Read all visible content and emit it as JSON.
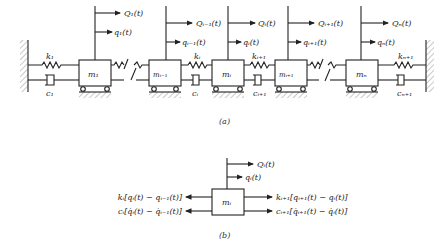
{
  "figure_a": {
    "caption": "(a)",
    "masses": [
      {
        "label": "m1",
        "text": "m₁"
      },
      {
        "label": "m_{i-1}",
        "text": "mᵢ₋₁"
      },
      {
        "label": "m_i",
        "text": "mᵢ"
      },
      {
        "label": "m_{i+1}",
        "text": "mᵢ₊₁"
      },
      {
        "label": "m_n",
        "text": "mₙ"
      }
    ],
    "forces": [
      {
        "Q": "Q₁(t)",
        "q": "q₁(t)"
      },
      {
        "Q": "Qᵢ₋₁(t)",
        "q": "qᵢ₋₁(t)"
      },
      {
        "Q": "Qᵢ(t)",
        "q": "qᵢ(t)"
      },
      {
        "Q": "Qᵢ₊₁(t)",
        "q": "qᵢ₊₁(t)"
      },
      {
        "Q": "Qₙ(t)",
        "q": "qₙ(t)"
      }
    ],
    "springs": [
      "k₁",
      "kᵢ",
      "kᵢ₊₁",
      "kₙ₊₁"
    ],
    "dampers": [
      "c₁",
      "cᵢ",
      "cᵢ₊₁",
      "cₙ₊₁"
    ]
  },
  "figure_b": {
    "caption": "(b)",
    "mass": "mᵢ",
    "Q": "Qᵢ(t)",
    "q": "qᵢ(t)",
    "left_spring_force": "kᵢ[qᵢ(t) − qᵢ₋₁(t)]",
    "left_damper_force": "cᵢ[q̇ᵢ(t) − q̇ᵢ₋₁(t)]",
    "right_spring_force": "kᵢ₊₁[qᵢ₊₁(t) − qᵢ(t)]",
    "right_damper_force": "cᵢ₊₁[q̇ᵢ₊₁(t) − q̇ᵢ(t)]"
  }
}
